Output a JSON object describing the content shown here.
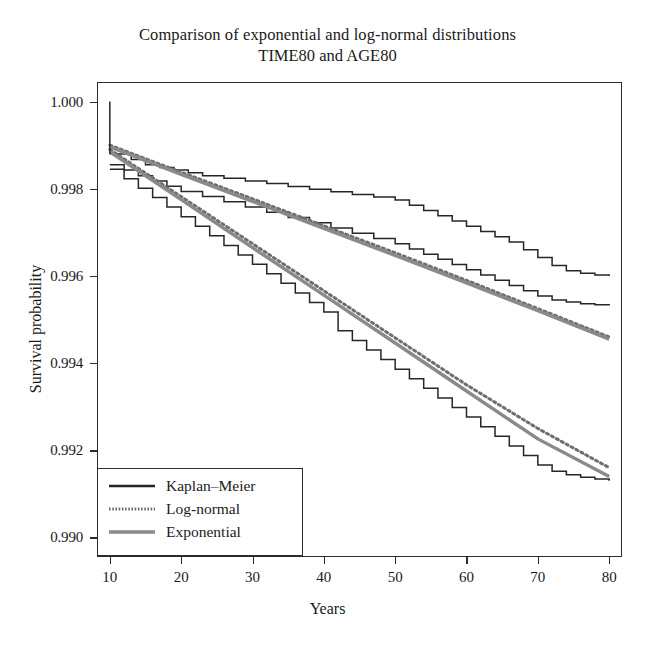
{
  "chart_data": {
    "type": "line",
    "title": "Comparison of exponential and log-normal distributions",
    "subtitle": "TIME80 and AGE80",
    "xlabel": "Years",
    "ylabel": "Survival probability",
    "xlim": [
      8.2,
      81.8
    ],
    "ylim": [
      0.98955,
      1.00045
    ],
    "xticks": [
      10,
      20,
      30,
      40,
      50,
      60,
      70,
      80
    ],
    "xtick_labels": [
      "10",
      "20",
      "30",
      "40",
      "50",
      "60",
      "70",
      "80"
    ],
    "yticks": [
      0.99,
      0.992,
      0.994,
      0.996,
      0.998,
      1.0
    ],
    "ytick_labels": [
      "0.990",
      "0.992",
      "0.994",
      "0.996",
      "0.998",
      "1.000"
    ],
    "grid": false,
    "legend_position": "bottom-left",
    "legend": [
      {
        "label": "Kaplan–Meier",
        "style": "solid",
        "color": "#262626",
        "width": 2.0
      },
      {
        "label": "Log-normal",
        "style": "dotted",
        "color": "#6e6e6e",
        "width": 2.2
      },
      {
        "label": "Exponential",
        "style": "solid",
        "color": "#8a8a8a",
        "width": 3.0
      }
    ],
    "groups": [
      "TIME80",
      "AGE80"
    ],
    "series": [
      {
        "name": "AGE80 Kaplan-Meier upper",
        "group": "AGE80",
        "model": "Kaplan-Meier",
        "style": "step",
        "color": "#262626",
        "x": [
          10,
          11,
          13,
          15,
          17,
          19,
          21,
          23,
          26,
          29,
          32,
          35,
          38,
          41,
          44,
          47,
          50,
          52,
          54,
          56,
          58,
          60,
          62,
          64,
          66,
          68,
          70,
          72,
          74,
          76,
          78,
          80
        ],
        "y": [
          0.9988,
          0.9988,
          0.99867,
          0.99855,
          0.99849,
          0.99843,
          0.99837,
          0.9983,
          0.99824,
          0.99818,
          0.99812,
          0.99805,
          0.99799,
          0.99793,
          0.99787,
          0.99781,
          0.99774,
          0.99762,
          0.9975,
          0.99738,
          0.99726,
          0.99714,
          0.99702,
          0.9969,
          0.99678,
          0.9966,
          0.99642,
          0.99624,
          0.99612,
          0.99606,
          0.99602,
          0.996
        ]
      },
      {
        "name": "TIME80 Kaplan-Meier upper",
        "group": "TIME80",
        "model": "Kaplan-Meier",
        "style": "step",
        "color": "#262626",
        "x": [
          10,
          12,
          14,
          16,
          18,
          20,
          23,
          26,
          29,
          32,
          35,
          38,
          41,
          44,
          47,
          50,
          52,
          54,
          56,
          58,
          60,
          62,
          64,
          66,
          68,
          70,
          72,
          74,
          76,
          78,
          80
        ],
        "y": [
          0.99855,
          0.99843,
          0.9983,
          0.99818,
          0.99806,
          0.99794,
          0.99782,
          0.9977,
          0.99758,
          0.99746,
          0.99734,
          0.99722,
          0.9971,
          0.99698,
          0.99686,
          0.99674,
          0.99662,
          0.9965,
          0.99638,
          0.99626,
          0.99614,
          0.99602,
          0.9959,
          0.99578,
          0.99566,
          0.99554,
          0.99545,
          0.9954,
          0.99536,
          0.99534,
          0.99532
        ]
      },
      {
        "name": "Log-normal upper",
        "group": "AGE80",
        "model": "Log-normal",
        "style": "dotted",
        "color": "#6e6e6e",
        "x": [
          10,
          20,
          30,
          40,
          50,
          60,
          70,
          80
        ],
        "y": [
          0.999,
          0.99838,
          0.99777,
          0.99715,
          0.99653,
          0.9959,
          0.99525,
          0.9946
        ]
      },
      {
        "name": "Exponential upper",
        "group": "AGE80",
        "model": "Exponential",
        "style": "solid",
        "color": "#8a8a8a",
        "x": [
          10,
          20,
          30,
          40,
          50,
          60,
          70,
          80
        ],
        "y": [
          0.99896,
          0.99833,
          0.99771,
          0.99709,
          0.99647,
          0.99584,
          0.9952,
          0.99455
        ]
      },
      {
        "name": "Kaplan-Meier lower",
        "group": "TIME80",
        "model": "Kaplan-Meier",
        "style": "step",
        "color": "#262626",
        "x": [
          10,
          12,
          14,
          16,
          18,
          20,
          22,
          24,
          26,
          28,
          30,
          32,
          34,
          36,
          38,
          40,
          42,
          44,
          46,
          48,
          50,
          52,
          54,
          56,
          58,
          60,
          62,
          64,
          66,
          68,
          70,
          72,
          74,
          76,
          78,
          80
        ],
        "y": [
          0.99845,
          0.99823,
          0.99801,
          0.9978,
          0.99758,
          0.99736,
          0.99714,
          0.99692,
          0.9967,
          0.99648,
          0.99627,
          0.99605,
          0.99583,
          0.99561,
          0.99539,
          0.99517,
          0.99474,
          0.99452,
          0.9943,
          0.99408,
          0.99386,
          0.99364,
          0.99342,
          0.9932,
          0.99298,
          0.99276,
          0.99254,
          0.99232,
          0.9921,
          0.99188,
          0.99166,
          0.99152,
          0.99144,
          0.99138,
          0.99134,
          0.9913
        ]
      },
      {
        "name": "Log-normal lower",
        "group": "TIME80",
        "model": "Log-normal",
        "style": "dotted",
        "color": "#6e6e6e",
        "x": [
          10,
          20,
          30,
          40,
          50,
          60,
          70,
          80
        ],
        "y": [
          0.9989,
          0.99782,
          0.99674,
          0.99566,
          0.99458,
          0.9935,
          0.9925,
          0.9916
        ]
      },
      {
        "name": "Exponential lower",
        "group": "TIME80",
        "model": "Exponential",
        "style": "solid",
        "color": "#8a8a8a",
        "x": [
          10,
          20,
          30,
          40,
          50,
          60,
          70,
          80
        ],
        "y": [
          0.99885,
          0.99775,
          0.99665,
          0.99556,
          0.99446,
          0.99336,
          0.99226,
          0.9914
        ]
      }
    ]
  }
}
